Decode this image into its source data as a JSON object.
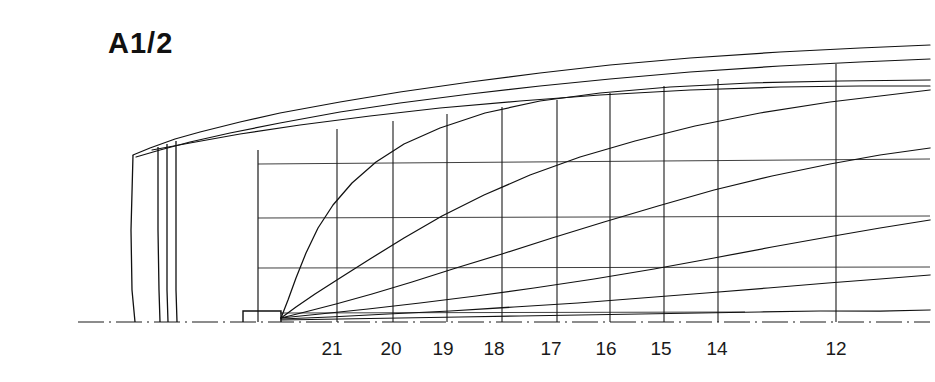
{
  "drawing": {
    "title": "A1/2",
    "type": "ship-lines-plan",
    "width": 935,
    "height": 382,
    "ink_color": "#111111",
    "background_color": "#ffffff"
  },
  "axis": {
    "baseline_y": 322,
    "baseline_x_start": 78,
    "baseline_x_end": 930,
    "label_y": 338,
    "stations": [
      {
        "label": "21",
        "x": 332
      },
      {
        "label": "20",
        "x": 391
      },
      {
        "label": "19",
        "x": 443
      },
      {
        "label": "18",
        "x": 494
      },
      {
        "label": "17",
        "x": 551
      },
      {
        "label": "16",
        "x": 606
      },
      {
        "label": "15",
        "x": 661
      },
      {
        "label": "14",
        "x": 717
      },
      {
        "label": "12",
        "x": 836
      }
    ]
  },
  "chart_data": {
    "type": "line",
    "title": "A1/2",
    "xlabel": "",
    "ylabel": "",
    "grid": true,
    "legend": "none",
    "categories": [
      "21",
      "20",
      "19",
      "18",
      "17",
      "16",
      "15",
      "14",
      "12"
    ],
    "station_lines": [
      {
        "label": "21",
        "x": 337,
        "y_top": 129,
        "y_bottom": 322
      },
      {
        "label": "20",
        "x": 393,
        "y_top": 121,
        "y_bottom": 322
      },
      {
        "label": "19",
        "x": 447,
        "y_top": 114,
        "y_bottom": 322
      },
      {
        "label": "18",
        "x": 502,
        "y_top": 107,
        "y_bottom": 322
      },
      {
        "label": "17",
        "x": 557,
        "y_top": 100,
        "y_bottom": 322
      },
      {
        "label": "16",
        "x": 610,
        "y_top": 93,
        "y_bottom": 322
      },
      {
        "label": "15",
        "x": 664,
        "y_top": 86,
        "y_bottom": 322
      },
      {
        "label": "14",
        "x": 718,
        "y_top": 79,
        "y_bottom": 322
      },
      {
        "label": "12",
        "x": 836,
        "y_top": 64,
        "y_bottom": 322
      }
    ],
    "waterlines": [
      {
        "name": "waterline-1",
        "y_left": 164,
        "y_right": 159,
        "x_start": 258,
        "x_end": 930
      },
      {
        "name": "waterline-2",
        "y_left": 218,
        "y_right": 216,
        "x_start": 258,
        "x_end": 930
      },
      {
        "name": "waterline-3",
        "y_left": 268,
        "y_right": 267,
        "x_start": 258,
        "x_end": 930
      },
      {
        "name": "waterline-4",
        "y_left": 313,
        "y_right": 312,
        "x_start": 280,
        "x_end": 745
      }
    ],
    "sheer_lines": [
      {
        "name": "deck-edge-upper",
        "points": "133,155 150,148 175,139 200,132 240,122 280,113 340,102 400,92 470,82 540,73 610,65 690,58 780,52 860,48 930,45"
      },
      {
        "name": "deck-edge-lower",
        "points": "136,157 160,150 190,142 230,133 280,123 340,112 400,103 470,94 540,86 610,79 690,72 780,66 860,62 930,59"
      },
      {
        "name": "sheer-intermediate",
        "points": "152,150 190,143 240,134 300,125 370,116 440,108 520,101 600,95 690,90 780,87 860,86 930,86"
      }
    ],
    "buttock_lines": [
      {
        "name": "buttock-1",
        "points": "281,318 288,300 296,278 306,253 318,228 333,205 352,183 376,162 404,144 440,128 485,113 540,101 600,93 670,87 750,83 840,81 930,80"
      },
      {
        "name": "buttock-2",
        "points": "281,318 296,307 315,294 340,278 370,259 404,238 442,216 484,195 530,175 580,157 635,141 695,126 760,113 830,102 880,96 930,90"
      },
      {
        "name": "buttock-3",
        "points": "281,318 305,312 336,304 372,294 412,282 456,268 502,254 552,238 604,222 658,206 714,190 772,176 830,164 880,155 930,148"
      },
      {
        "name": "buttock-4",
        "points": "281,318 320,314 368,309 420,303 476,296 534,288 594,279 654,269 714,258 772,247 828,237 880,228 930,220"
      },
      {
        "name": "buttock-5",
        "points": "281,319 330,317 388,314 450,311 514,307 578,303 642,298 706,293 768,288 828,283 880,279 930,275"
      },
      {
        "name": "flat-of-bottom",
        "points": "281,320 340,319 400,318 460,317 520,316 580,315 640,314 700,313 760,312 820,311 880,311 930,310"
      }
    ],
    "transom_lines": [
      {
        "name": "transom-outer",
        "points": "133,155 131,230 132,290 135,322"
      },
      {
        "name": "transom-inner-1",
        "points": "158,147 158,230 159,290 160,322"
      },
      {
        "name": "transom-inner-2",
        "points": "167,144 167,230 167,290 168,322"
      },
      {
        "name": "transom-inner-3",
        "points": "176,141 176,230 176,290 177,322"
      }
    ],
    "keel_block": {
      "x": 243,
      "y": 311,
      "width": 38,
      "height": 11
    },
    "grid_left_edge": {
      "x": 258,
      "y_top": 150,
      "y_bottom": 322
    }
  }
}
